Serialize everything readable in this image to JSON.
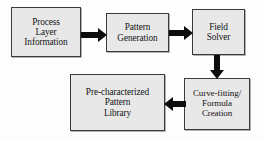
{
  "diagram": {
    "background_color": "#fdfdfd",
    "node_fill_color": "#e8e8e8",
    "node_border_color": "#3a3a3a",
    "arrow_color": "#0d0d0d",
    "nodes": [
      {
        "id": "process-layer-information",
        "lines": [
          "Process",
          "Layer",
          "Information"
        ]
      },
      {
        "id": "pattern-generation",
        "lines": [
          "Pattern",
          "Generation"
        ]
      },
      {
        "id": "field-solver",
        "lines": [
          "Field",
          "Solver"
        ]
      },
      {
        "id": "curve-fitting-formula-creation",
        "lines": [
          "Curve-fitting/",
          "Formula",
          "Creation"
        ]
      },
      {
        "id": "pre-characterized-pattern-library",
        "lines": [
          "Pre-characterized",
          "Pattern",
          "Library"
        ]
      }
    ],
    "edges": [
      {
        "id": "process-to-pattern",
        "from": "process-layer-information",
        "to": "pattern-generation",
        "direction": "right"
      },
      {
        "id": "pattern-to-field",
        "from": "pattern-generation",
        "to": "field-solver",
        "direction": "right"
      },
      {
        "id": "field-to-curve",
        "from": "field-solver",
        "to": "curve-fitting-formula-creation",
        "direction": "down"
      },
      {
        "id": "curve-to-library",
        "from": "curve-fitting-formula-creation",
        "to": "pre-characterized-pattern-library",
        "direction": "left"
      }
    ]
  }
}
